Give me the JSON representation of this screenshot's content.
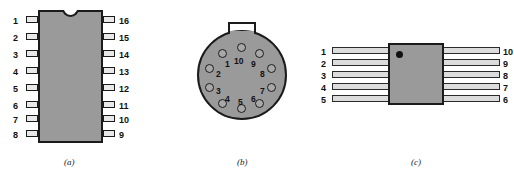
{
  "figure": {
    "colors": {
      "body_fill": "#9a9a9a",
      "outline": "#1b1b1b",
      "background": "#ffffff",
      "lead_fill": "#e8e8e8",
      "marker_dot": "#111111"
    }
  },
  "packages": [
    {
      "id": "dip",
      "caption": "(a)",
      "kind": "dual-in-line-package",
      "pin_count": 16,
      "has_notch": true,
      "left_pins": [
        "1",
        "2",
        "3",
        "4",
        "5",
        "6",
        "7",
        "8"
      ],
      "right_pins": [
        "16",
        "15",
        "14",
        "13",
        "12",
        "11",
        "10",
        "9"
      ]
    },
    {
      "id": "can",
      "caption": "(b)",
      "kind": "round-metal-can-package",
      "pin_count": 10,
      "has_tab": true,
      "pins": [
        "1",
        "2",
        "3",
        "4",
        "5",
        "6",
        "7",
        "8",
        "9",
        "10"
      ]
    },
    {
      "id": "flatpack",
      "caption": "(c)",
      "kind": "flat-package",
      "pin_count": 10,
      "has_pin1_dot": true,
      "left_pins": [
        "1",
        "2",
        "3",
        "4",
        "5"
      ],
      "right_pins": [
        "10",
        "9",
        "8",
        "7",
        "6"
      ]
    }
  ]
}
